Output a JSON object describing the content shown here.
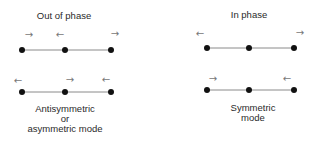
{
  "panels": [
    {
      "id": "out-of-phase",
      "title": "Out of phase",
      "rows": [
        {
          "arrows": [
            "→",
            "←",
            "→"
          ],
          "directions": [
            "right",
            "left",
            "right"
          ]
        },
        {
          "arrows": [
            "←",
            "→",
            "←"
          ],
          "directions": [
            "left",
            "right",
            "left"
          ]
        }
      ],
      "caption": [
        "Antisymmetric",
        "or",
        "asymmetric mode"
      ]
    },
    {
      "id": "in-phase",
      "title": "In phase",
      "rows": [
        {
          "arrows": [
            "←",
            "→"
          ],
          "directions": [
            "left",
            "right"
          ]
        },
        {
          "arrows": [
            "→",
            "←"
          ],
          "directions": [
            "right",
            "left"
          ]
        }
      ],
      "caption": [
        "Symmetric",
        "mode"
      ]
    }
  ],
  "colors": {
    "line": "#8a8a8a",
    "dot": "#111111",
    "arrow": "#777777",
    "text": "#2a2a2a"
  }
}
